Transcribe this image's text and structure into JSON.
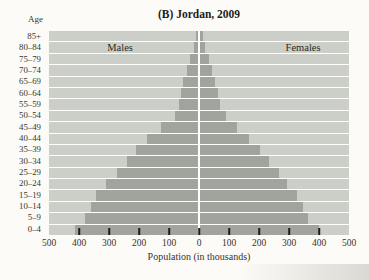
{
  "title": "(B) Jordan, 2009",
  "age_header": "Age",
  "x_axis_label": "Population (in thousands)",
  "legend": {
    "left": "Males",
    "right": "Females"
  },
  "x_tick_labels": [
    "500",
    "400",
    "300",
    "200",
    "100",
    "0",
    "100",
    "200",
    "300",
    "400",
    "500"
  ],
  "colors": {
    "page_bg": "#fcfbf7",
    "plot_bg": "#cccfc7",
    "bar": "#a0a49d",
    "grid_line": "#ffffff",
    "tick_mark": "#1d1c19",
    "text": "#2e2a24"
  },
  "chart_data": {
    "type": "bar",
    "subtype": "population-pyramid",
    "title": "(B) Jordan, 2009",
    "xlabel": "Population (in thousands)",
    "ylabel": "Age",
    "categories": [
      "85+",
      "80–84",
      "75–79",
      "70–74",
      "65–69",
      "60–64",
      "55–59",
      "50–54",
      "45–49",
      "40–44",
      "35–39",
      "30–34",
      "25–29",
      "20–24",
      "15–19",
      "10–14",
      "5–9",
      "0–4"
    ],
    "categories_order": "top-to-bottom",
    "units": "thousands",
    "xlim": [
      -500,
      500
    ],
    "x_tick_step": 100,
    "grid": "horizontal-white-lines",
    "legend_position": "inside-top",
    "series": [
      {
        "name": "Males",
        "side": "left",
        "values": [
          11,
          18,
          29,
          40,
          53,
          59,
          67,
          80,
          127,
          175,
          210,
          240,
          275,
          310,
          343,
          360,
          380,
          415
        ]
      },
      {
        "name": "Females",
        "side": "right",
        "values": [
          13,
          20,
          32,
          44,
          53,
          63,
          70,
          89,
          126,
          165,
          202,
          232,
          265,
          293,
          325,
          345,
          362,
          400
        ]
      }
    ]
  }
}
